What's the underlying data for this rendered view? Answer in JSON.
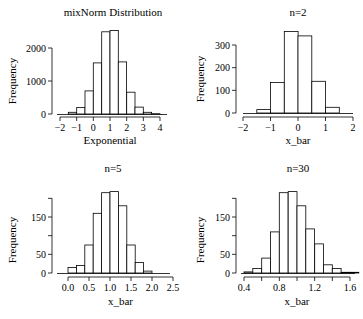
{
  "chart_data": [
    {
      "type": "bar",
      "title": "mixNorm Distribution",
      "xlabel": "Exponential",
      "ylabel": "Frequency",
      "bin_edges": [
        -1.5,
        -1.0,
        -0.5,
        0.0,
        0.5,
        1.0,
        1.5,
        2.0,
        2.5,
        3.0,
        3.5,
        4.0
      ],
      "values": [
        50,
        200,
        700,
        1550,
        2490,
        2530,
        1580,
        660,
        210,
        50,
        10
      ],
      "xlim": [
        -2,
        4.5
      ],
      "ylim": [
        0,
        2600
      ],
      "xticks": [
        -2,
        -1,
        0,
        1,
        2,
        3,
        4
      ],
      "xtick_labels": [
        "−2",
        "−1",
        "0",
        "1",
        "2",
        "3",
        "4"
      ],
      "yticks": [
        0,
        1000,
        2000
      ],
      "ytick_labels": [
        "0",
        "1000",
        "2000"
      ],
      "grid": false
    },
    {
      "type": "bar",
      "title": "n=2",
      "xlabel": "x_bar",
      "ylabel": "Frequency",
      "bin_edges": [
        -1.5,
        -1.0,
        -0.5,
        0.0,
        0.5,
        1.0,
        1.5
      ],
      "values": [
        15,
        135,
        360,
        340,
        140,
        25
      ],
      "xlim": [
        -2,
        2
      ],
      "ylim": [
        0,
        360
      ],
      "xticks": [
        -2,
        -1,
        0,
        1,
        2
      ],
      "xtick_labels": [
        "−2",
        "−1",
        "0",
        "1",
        "2"
      ],
      "yticks": [
        0,
        100,
        200,
        300
      ],
      "ytick_labels": [
        "0",
        "100",
        "200",
        "300"
      ],
      "grid": false
    },
    {
      "type": "bar",
      "title": "n=5",
      "xlabel": "x_bar",
      "ylabel": "Frequency",
      "bin_edges": [
        0.0,
        0.2,
        0.4,
        0.6,
        0.8,
        1.0,
        1.2,
        1.4,
        1.6,
        1.8,
        2.0
      ],
      "values": [
        15,
        20,
        75,
        160,
        215,
        218,
        180,
        75,
        28,
        5
      ],
      "xlim": [
        -0.1,
        2.5
      ],
      "ylim": [
        0,
        220
      ],
      "xticks": [
        0.0,
        0.5,
        1.0,
        1.5,
        2.0,
        2.5
      ],
      "xtick_labels": [
        "0.0",
        "0.5",
        "1.0",
        "1.5",
        "2.0",
        "2.5"
      ],
      "yticks": [
        0,
        50,
        100,
        150,
        200
      ],
      "ytick_labels": [
        "0",
        "50",
        "",
        "150",
        ""
      ],
      "grid": false
    },
    {
      "type": "bar",
      "title": "n=30",
      "xlabel": "x_bar",
      "ylabel": "Frequency",
      "bin_edges": [
        0.4,
        0.5,
        0.6,
        0.7,
        0.8,
        0.9,
        1.0,
        1.1,
        1.2,
        1.3,
        1.4,
        1.5,
        1.6,
        1.7
      ],
      "values": [
        3,
        12,
        40,
        110,
        215,
        218,
        180,
        118,
        78,
        22,
        12,
        2,
        2
      ],
      "xlim": [
        0.4,
        1.7
      ],
      "ylim": [
        0,
        220
      ],
      "xticks": [
        0.4,
        0.6,
        0.8,
        1.0,
        1.2,
        1.4,
        1.6
      ],
      "xtick_labels": [
        "0.4",
        "",
        "0.8",
        "",
        "1.2",
        "",
        "1.6"
      ],
      "yticks": [
        0,
        50,
        100,
        150,
        200
      ],
      "ytick_labels": [
        "0",
        "50",
        "",
        "150",
        ""
      ],
      "grid": false
    }
  ],
  "panels": [
    {
      "x0": 60,
      "x1": 160,
      "xmin": -2,
      "xmax": 4,
      "baseline": 114,
      "ytop_val": 2000,
      "ytop_px": 48,
      "axis_y": 117,
      "title_x": 113,
      "title_y": 16,
      "xlabel_y": 144,
      "ylabel_x": 16,
      "ylabel_y": 81,
      "yaxis_x": 52,
      "ytick_top": 32,
      "hist_x0": 57,
      "hist_x1": 167
    },
    {
      "x0": 243,
      "x1": 353,
      "xmin": -2,
      "xmax": 2,
      "baseline": 113,
      "ytop_val": 300,
      "ytop_px": 45,
      "axis_y": 117,
      "title_x": 298,
      "title_y": 16,
      "xlabel_y": 144,
      "ylabel_x": 204,
      "ylabel_y": 79,
      "yaxis_x": 236,
      "ytick_top": 33,
      "hist_x0": 243,
      "hist_x1": 353
    },
    {
      "x0": 68,
      "x1": 173,
      "xmin": 0,
      "xmax": 2.5,
      "baseline": 273,
      "ytop_val": 150,
      "ytop_px": 217,
      "axis_y": 277,
      "title_x": 113,
      "title_y": 172,
      "xlabel_y": 305,
      "ylabel_x": 16,
      "ylabel_y": 240,
      "yaxis_x": 52,
      "ytick_top": 198,
      "hist_x0": 57,
      "hist_x1": 170
    },
    {
      "x0": 244,
      "x1": 350,
      "xmin": 0.4,
      "xmax": 1.6,
      "baseline": 273,
      "ytop_val": 150,
      "ytop_px": 217,
      "axis_y": 277,
      "title_x": 298,
      "title_y": 172,
      "xlabel_y": 305,
      "ylabel_x": 204,
      "ylabel_y": 240,
      "yaxis_x": 236,
      "ytick_top": 198,
      "hist_x0": 241,
      "hist_x1": 355
    }
  ]
}
